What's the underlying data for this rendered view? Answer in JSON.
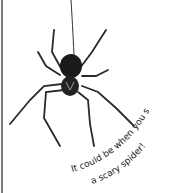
{
  "image": {
    "subject": "spider hanging from a thread",
    "caption_line1": "It could be when you see",
    "caption_line2": "a scary spider!",
    "colors": {
      "background": "#ffffff",
      "spider": "#1a1a1a",
      "thread": "#333333",
      "frame_line": "#7a7a7a",
      "text": "#222222"
    }
  }
}
